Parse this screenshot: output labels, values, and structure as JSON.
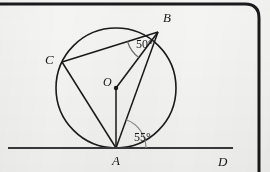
{
  "figure": {
    "background_color": "#f4f4f2",
    "ink_color": "#19191b",
    "frame": {
      "top_border": true,
      "right_border": true,
      "corner_radius": 14,
      "color": "#1a1a1c"
    },
    "circle": {
      "center_label": "O",
      "cx": 116,
      "cy": 88,
      "r": 60,
      "stroke_color": "#1a1a1c"
    },
    "points": [
      {
        "name": "A",
        "label": "A",
        "x": 116,
        "y": 148,
        "label_x": 112,
        "label_y": 165
      },
      {
        "name": "B",
        "label": "B",
        "x": 158,
        "y": 32,
        "label_x": 163,
        "label_y": 22
      },
      {
        "name": "C",
        "label": "C",
        "x": 62,
        "y": 62,
        "label_x": 45,
        "label_y": 64
      },
      {
        "name": "O",
        "label": "O",
        "x": 116,
        "y": 88,
        "label_x": 103,
        "label_y": 86
      },
      {
        "name": "D",
        "label": "D",
        "x": 222,
        "y": 148,
        "label_x": 218,
        "label_y": 166
      }
    ],
    "tangent_line": {
      "name": "AD",
      "x1": 8,
      "y1": 148,
      "x2": 233,
      "y2": 148
    },
    "segments": [
      {
        "name": "CB",
        "from": "C",
        "to": "B"
      },
      {
        "name": "CA",
        "from": "C",
        "to": "A"
      },
      {
        "name": "AB",
        "from": "A",
        "to": "B"
      },
      {
        "name": "OB",
        "from": "O",
        "to": "B"
      },
      {
        "name": "OA",
        "from": "O",
        "to": "A"
      }
    ],
    "angles": [
      {
        "name": "angle-at-B",
        "label": "50°",
        "vertex": "B",
        "between": [
          "BC",
          "BO"
        ],
        "label_x": 136,
        "label_y": 48,
        "arc_radius": 32
      },
      {
        "name": "angle-at-A",
        "label": "55°",
        "vertex": "A",
        "between": [
          "AB",
          "AD"
        ],
        "label_x": 134,
        "label_y": 141,
        "arc_radius": 30
      }
    ],
    "center_dot": {
      "r": 2.2
    }
  }
}
